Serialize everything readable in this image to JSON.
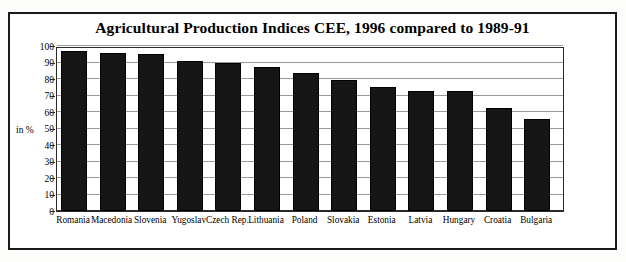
{
  "figure": {
    "title": "Agricultural Production Indices CEE, 1996 compared to 1989-91",
    "axis_unit_label": "in %",
    "frame_color": "#1a1a1a",
    "bar_color": "#151515",
    "gridline_color": "#9a9a9a",
    "background_color": "#ffffff"
  },
  "chart_data": {
    "type": "bar",
    "title": "Agricultural Production Indices CEE, 1996 compared to 1989-91",
    "xlabel": "",
    "ylabel": "in %",
    "ylim": [
      0,
      100
    ],
    "yticks": [
      0,
      10,
      20,
      30,
      40,
      50,
      60,
      70,
      80,
      90,
      100
    ],
    "grid": true,
    "legend": false,
    "categories": [
      "Romania",
      "Macedonia",
      "Slovenia",
      "Yugoslav",
      "Czech Rep.",
      "Lithuania",
      "Poland",
      "Slovakia",
      "Estonia",
      "Latvia",
      "Hungary",
      "Croatia",
      "Bulgaria"
    ],
    "values": [
      97,
      95.5,
      95,
      91,
      90,
      87,
      83.5,
      79.5,
      75,
      73,
      72.5,
      62.5,
      55.5
    ]
  }
}
